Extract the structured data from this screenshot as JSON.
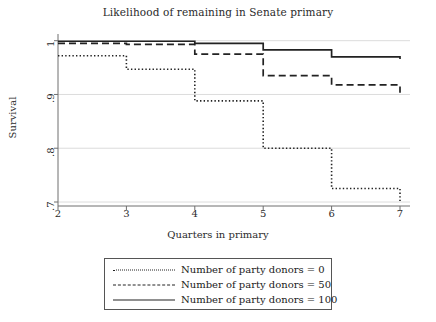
{
  "chart_data": {
    "type": "line",
    "title": "Likelihood of remaining in Senate primary",
    "xlabel": "Quarters in primary",
    "ylabel": "Survival",
    "xlim": [
      2,
      7
    ],
    "ylim": [
      0.7,
      1.005
    ],
    "xticks": [
      "2",
      "3",
      "4",
      "5",
      "6",
      "7"
    ],
    "yticks": [
      "1",
      ".9",
      ".8",
      ".7"
    ],
    "ytick_values": [
      1,
      0.9,
      0.8,
      0.7
    ],
    "grid": "horizontal-gridlines-at-yticks",
    "legend_position": "below-axes",
    "step_style": "step-post (survival / Kaplan-Meier)",
    "x": [
      2,
      3,
      4,
      5,
      6,
      7
    ],
    "series": [
      {
        "name": "Number of party donors = 0",
        "style": "dotted",
        "color": "#222222",
        "values": [
          0.972,
          0.947,
          0.888,
          0.8,
          0.725,
          0.702
        ]
      },
      {
        "name": "Number of party donors = 50",
        "style": "dashed",
        "color": "#222222",
        "values": [
          0.995,
          0.993,
          0.975,
          0.935,
          0.918,
          0.903
        ]
      },
      {
        "name": "Number of party donors = 100",
        "style": "solid",
        "color": "#222222",
        "values": [
          0.999,
          0.999,
          0.995,
          0.983,
          0.97,
          0.966
        ]
      }
    ]
  },
  "legend": {
    "items": [
      {
        "label": "Number of party donors = 0"
      },
      {
        "label": "Number of party donors = 50"
      },
      {
        "label": "Number of party donors = 100"
      }
    ]
  }
}
